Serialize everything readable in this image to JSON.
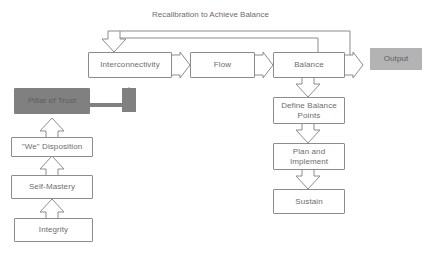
{
  "diagram": {
    "title_caption": "Recalibration to Achieve Balance",
    "colors": {
      "outline": "#8c8c8c",
      "text": "#6d6d6d",
      "pillar_fill": "#808080",
      "output_fill": "#b3b3b3",
      "thick_arrow_fill": "#808080",
      "background": "#ffffff"
    },
    "nodes": {
      "interconnectivity": {
        "label": "Interconnectivity"
      },
      "flow": {
        "label": "Flow"
      },
      "balance": {
        "label": "Balance"
      },
      "output": {
        "label": "Output"
      },
      "pillar_of_trust": {
        "label": "Pillar of Trust"
      },
      "we_disposition": {
        "label": "\"We\" Disposition"
      },
      "self_mastery": {
        "label": "Self-Mastery"
      },
      "integrity": {
        "label": "Integrity"
      },
      "define_balance_points": {
        "label": "Define Balance\nPoints"
      },
      "plan_and_implement": {
        "label": "Plan and\nImplement"
      },
      "sustain": {
        "label": "Sustain"
      }
    },
    "connections": [
      {
        "from": "interconnectivity",
        "to": "flow",
        "style": "hollow-chevron-right"
      },
      {
        "from": "flow",
        "to": "balance",
        "style": "hollow-chevron-right"
      },
      {
        "from": "balance",
        "to": "output",
        "style": "hollow-chevron-right"
      },
      {
        "from": "balance",
        "to": "define_balance_points",
        "style": "hollow-block-arrow-down"
      },
      {
        "from": "define_balance_points",
        "to": "plan_and_implement",
        "style": "hollow-block-arrow-down"
      },
      {
        "from": "plan_and_implement",
        "to": "sustain",
        "style": "hollow-block-arrow-down"
      },
      {
        "from": "integrity",
        "to": "self_mastery",
        "style": "hollow-block-arrow-up"
      },
      {
        "from": "self_mastery",
        "to": "we_disposition",
        "style": "hollow-block-arrow-up"
      },
      {
        "from": "we_disposition",
        "to": "pillar_of_trust",
        "style": "hollow-block-arrow-up"
      },
      {
        "from": "pillar_of_trust",
        "to": "interconnectivity",
        "style": "thick-solid-arrow-up-right"
      },
      {
        "from": "balance",
        "to": "interconnectivity",
        "style": "feedback-loop-inner",
        "label": "Recalibration to Achieve Balance"
      },
      {
        "from": "output",
        "to": "interconnectivity",
        "style": "feedback-loop-outer",
        "label": "Recalibration to Achieve Balance"
      }
    ]
  }
}
